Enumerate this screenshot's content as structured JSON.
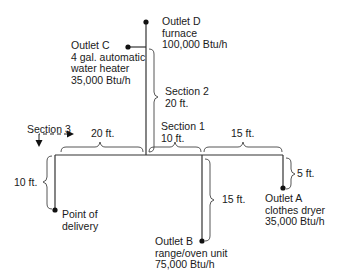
{
  "diagram": {
    "type": "gas piping layout",
    "outlets": [
      {
        "id": "A",
        "name": "Outlet A",
        "appliance": "clothes dryer",
        "rating": "35,000 Btu/h",
        "branch_length": "5 ft."
      },
      {
        "id": "B",
        "name": "Outlet B",
        "appliance": "range/oven unit",
        "rating": "75,000 Btu/h",
        "branch_length": "15 ft."
      },
      {
        "id": "C",
        "name": "Outlet C",
        "appliance": "4 gal. automatic",
        "appliance_line2": "water heater",
        "rating": "35,000 Btu/h"
      },
      {
        "id": "D",
        "name": "Outlet D",
        "appliance": "furnace",
        "rating": "100,000 Btu/h"
      }
    ],
    "point_of_delivery": {
      "line1": "Point of",
      "line2": "delivery",
      "riser_length": "10 ft."
    },
    "sections": [
      {
        "name": "Section 1",
        "length": "10 ft."
      },
      {
        "name": "Section 2",
        "length": "20 ft."
      },
      {
        "name": "Section 3",
        "length": "20 ft."
      }
    ],
    "dimension_labels": {
      "main_left": "20 ft.",
      "section1": "10 ft.",
      "main_right": "15 ft.",
      "riser": "10 ft.",
      "outlet_b": "15 ft.",
      "outlet_a": "5 ft."
    }
  }
}
